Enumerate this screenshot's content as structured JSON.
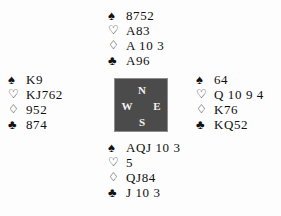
{
  "diagram": {
    "suit_symbols": {
      "spade": "♠",
      "heart": "♡",
      "diamond": "♢",
      "club": "♣"
    },
    "compass": {
      "north": "N",
      "west": "W",
      "east": "E",
      "south": "S",
      "box_color": "#4b4b4b",
      "label_color": "#f2f2f2"
    },
    "hands": {
      "north": {
        "seat": "North",
        "spades": "8752",
        "hearts": "A83",
        "diamonds": "A 10 3",
        "clubs": "A96"
      },
      "west": {
        "seat": "West",
        "spades": "K9",
        "hearts": "KJ762",
        "diamonds": "952",
        "clubs": "874"
      },
      "east": {
        "seat": "East",
        "spades": "64",
        "hearts": "Q 10 9 4",
        "diamonds": "K76",
        "clubs": "KQ52"
      },
      "south": {
        "seat": "South",
        "spades": "AQJ 10 3",
        "hearts": "5",
        "diamonds": "QJ84",
        "clubs": "J 10 3"
      }
    }
  }
}
